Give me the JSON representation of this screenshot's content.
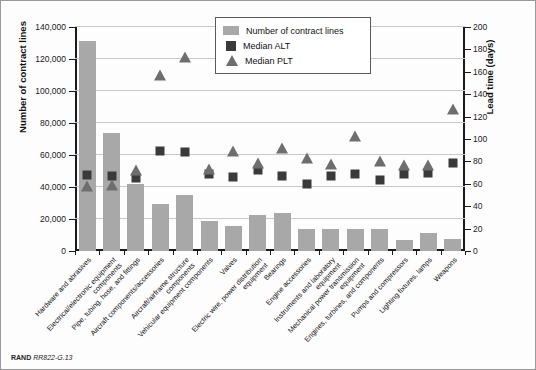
{
  "figure": {
    "footer_brand": "RAND",
    "footer_id": "RR822-G.13"
  },
  "legend": {
    "position": "top-center",
    "items": [
      {
        "label": "Number of contract lines",
        "marker": "bar-swatch",
        "color": "#a8a8a8"
      },
      {
        "label": "Median ALT",
        "marker": "square",
        "color": "#3a3a3a"
      },
      {
        "label": "Median PLT",
        "marker": "triangle",
        "color": "#6e6e6e"
      }
    ]
  },
  "chart_data": {
    "type": "bar",
    "title": "",
    "subtitle": "",
    "xlabel": "",
    "ylabel": "Number of contract lines",
    "y2label": "Lead time (days)",
    "ylim": [
      0,
      140000
    ],
    "y2lim": [
      0,
      200
    ],
    "grid": true,
    "legend_position": "top-center",
    "ytick_labels": [
      "0",
      "20,000",
      "40,000",
      "60,000",
      "80,000",
      "100,000",
      "120,000",
      "140,000"
    ],
    "ytick_values": [
      0,
      20000,
      40000,
      60000,
      80000,
      100000,
      120000,
      140000
    ],
    "y2tick_labels": [
      "0",
      "20",
      "40",
      "60",
      "80",
      "100",
      "120",
      "140",
      "160",
      "180",
      "200"
    ],
    "y2tick_values": [
      0,
      20,
      40,
      60,
      80,
      100,
      120,
      140,
      160,
      180,
      200
    ],
    "categories": [
      "Hardware and abrasives",
      "Electrical/electronic equipment components",
      "Pipe, tubing, hose, and fittings",
      "Aircraft components/accessories",
      "Aircraft/airframe structure components",
      "Vehicular equipment components",
      "Valves",
      "Electric wire, power distribution equipment",
      "Bearings",
      "Engine accessories",
      "Instruments and laboratory equipment",
      "Mechanical power transmission equipment",
      "Engines, turbines, and components",
      "Pumps and compressors",
      "Lighting fixtures, lamps",
      "Weapons"
    ],
    "series": [
      {
        "name": "Number of contract lines",
        "axis": "left",
        "type": "bar",
        "color": "#a8a8a8",
        "values": [
          131500,
          73500,
          42000,
          29500,
          35000,
          19000,
          15500,
          22500,
          23500,
          13500,
          14000,
          14000,
          13500,
          7000,
          11000,
          7500
        ]
      },
      {
        "name": "Median ALT",
        "axis": "right",
        "type": "scatter",
        "marker": "square",
        "color": "#3a3a3a",
        "units": "days",
        "values": [
          72,
          71,
          69,
          93,
          92,
          73,
          70,
          76,
          71,
          64,
          71,
          73,
          67,
          73,
          74,
          83
        ]
      },
      {
        "name": "Median PLT",
        "axis": "right",
        "type": "scatter",
        "marker": "triangle",
        "color": "#6e6e6e",
        "units": "days",
        "values": [
          58,
          59,
          72,
          157,
          173,
          73,
          89,
          79,
          92,
          83,
          78,
          103,
          80,
          77,
          77,
          127
        ]
      }
    ]
  }
}
